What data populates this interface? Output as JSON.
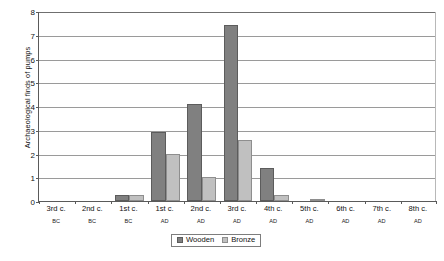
{
  "chart_data": {
    "type": "bar",
    "title": "",
    "xlabel": "",
    "ylabel": "Archaeological finds of pumps",
    "ylim": [
      0,
      8
    ],
    "yticks": [
      0,
      1,
      2,
      3,
      4,
      5,
      6,
      7,
      8
    ],
    "grid": true,
    "legend_position": "bottom-center",
    "categories": [
      "3rd c. BC",
      "2nd c. BC",
      "1st c. BC",
      "1st c. AD",
      "2nd c. AD",
      "3rd c. AD",
      "4th c. AD",
      "5th c. AD",
      "6th c. AD",
      "7th c. AD",
      "8th c. AD"
    ],
    "category_labels": [
      {
        "century": "3rd c.",
        "era": "BC"
      },
      {
        "century": "2nd c.",
        "era": "BC"
      },
      {
        "century": "1st c.",
        "era": "BC"
      },
      {
        "century": "1st c.",
        "era": "AD"
      },
      {
        "century": "2nd c.",
        "era": "AD"
      },
      {
        "century": "3rd c.",
        "era": "AD"
      },
      {
        "century": "4th c.",
        "era": "AD"
      },
      {
        "century": "5th c.",
        "era": "AD"
      },
      {
        "century": "6th c.",
        "era": "AD"
      },
      {
        "century": "7th c.",
        "era": "AD"
      },
      {
        "century": "8th c.",
        "era": "AD"
      }
    ],
    "series": [
      {
        "name": "Wooden",
        "color": "#808080",
        "values": [
          0,
          0,
          0.25,
          2.9,
          4.1,
          7.4,
          1.4,
          0,
          0,
          0,
          0
        ]
      },
      {
        "name": "Bronze",
        "color": "#c0c0c0",
        "values": [
          0,
          0,
          0.27,
          2.0,
          1.0,
          2.55,
          0.27,
          0.05,
          0,
          0,
          0
        ]
      }
    ]
  },
  "legend": {
    "entries": [
      {
        "label": "Wooden"
      },
      {
        "label": "Bronze"
      }
    ]
  },
  "caption": {
    "text": ""
  },
  "colors": {
    "wooden": "#808080",
    "bronze": "#c0c0c0",
    "axis": "#5a5a5a",
    "grid": "#9a9a9a",
    "background": "#ffffff"
  }
}
